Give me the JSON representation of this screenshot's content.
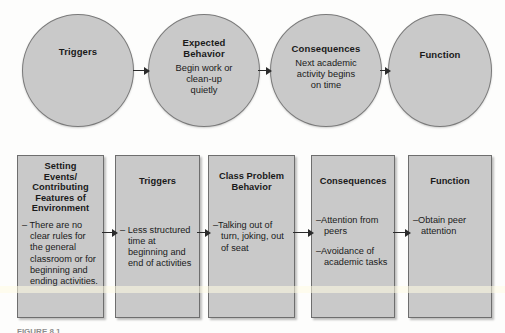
{
  "diagram": {
    "colors": {
      "node_fill": "#c9c9c9",
      "node_border": "#6e6e6e",
      "arrow": "#2b2b2b",
      "text": "#1a1a1a",
      "page_background": "#fdfdfc"
    },
    "top_row": {
      "type": "desired-pathway-circles",
      "nodes": [
        {
          "id": "triggers",
          "title": "Triggers",
          "body": ""
        },
        {
          "id": "expected-behavior",
          "title": "Expected\nBehavior",
          "body": "Begin work or\nclean-up\nquietly"
        },
        {
          "id": "consequences",
          "title": "Consequences",
          "body": "Next academic\nactivity begins\non time"
        },
        {
          "id": "function",
          "title": "Function",
          "body": ""
        }
      ],
      "connectors": [
        "arrow-right",
        "arrow-right",
        "arrow-right"
      ]
    },
    "bottom_row": {
      "type": "problem-pathway-boxes",
      "nodes": [
        {
          "id": "setting-events",
          "title": "Setting\nEvents/\nContributing\nFeatures of\nEnvironment",
          "items": [
            "– There are no clear rules for the general classroom or for beginning and ending activities."
          ]
        },
        {
          "id": "triggers",
          "title": "Triggers",
          "items": [
            "– Less structured time at beginning and end of activities"
          ]
        },
        {
          "id": "class-problem-behavior",
          "title": "Class Problem\nBehavior",
          "items": [
            "–Talking out of turn, joking, out of seat"
          ]
        },
        {
          "id": "consequences",
          "title": "Consequences",
          "items": [
            "–Attention from peers",
            "–Avoidance of academic tasks"
          ]
        },
        {
          "id": "function",
          "title": "Function",
          "items": [
            "–Obtain peer attention"
          ]
        }
      ],
      "connectors": [
        "arrow-right",
        "arrow-right",
        "arrow-right",
        "arrow-right"
      ]
    },
    "caption": "FIGURE 8.1"
  }
}
